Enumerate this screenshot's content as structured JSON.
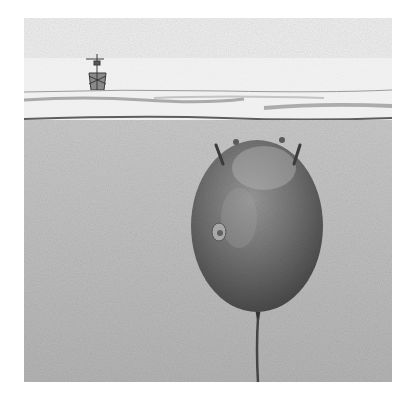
{
  "image": {
    "description": "Pencil illustration of a naval sea mine tethered underwater with a ship on the horizon",
    "alt_text": "Sea mine underwater below a ship on the horizon"
  },
  "scene": {
    "elements": [
      "sky",
      "ship",
      "horizon-waves",
      "water",
      "sea-mine",
      "mine-horns",
      "mooring-cable"
    ]
  },
  "colors": {
    "sky": "#f4f4f4",
    "water": "#bdbdbd",
    "mine": "#6e6e6e",
    "cable": "#444444"
  }
}
